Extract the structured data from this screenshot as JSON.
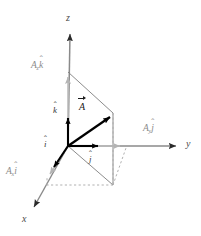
{
  "figure": {
    "background_color": "#ffffff",
    "width": 201,
    "height": 236
  },
  "colors": {
    "axis": "#6e6e6e",
    "vector": "#000000",
    "component_gray": "#b0b0b0",
    "construction_solid": "#7a7a7a",
    "construction_dashed": "#a8a8a8",
    "label_dark": "#1a1a1a",
    "label_gray": "#8a8a8a"
  },
  "axes": [
    {
      "name": "z",
      "label": "z",
      "direction": "up",
      "tip_x": 70,
      "tip_y": 28
    },
    {
      "name": "y",
      "label": "y",
      "direction": "right",
      "tip_x": 183,
      "tip_y": 146
    },
    {
      "name": "x",
      "label": "x",
      "direction": "down-left",
      "tip_x": 31,
      "tip_y": 212
    }
  ],
  "origin": {
    "x": 68,
    "y": 146
  },
  "vector": {
    "label_main": "A",
    "tip_x": 113,
    "tip_y": 113
  },
  "unit_vectors": [
    {
      "name": "i-hat",
      "base": "i",
      "label_x": 46,
      "label_y": 143
    },
    {
      "name": "j-hat",
      "base": "j",
      "label_x": 92,
      "label_y": 157
    },
    {
      "name": "k-hat",
      "base": "k",
      "label_x": 55,
      "label_y": 109
    }
  ],
  "components": [
    {
      "name": "z-component",
      "coefficient": "A",
      "subscript": "z",
      "unit": "k",
      "label_x": 33,
      "label_y": 65,
      "arrow_tip_x": 68,
      "arrow_tip_y": 72
    },
    {
      "name": "y-component",
      "coefficient": "A",
      "subscript": "y",
      "unit": "j",
      "label_x": 146,
      "label_y": 129,
      "arrow_tip_x": 125,
      "arrow_tip_y": 146
    },
    {
      "name": "x-component",
      "coefficient": "A",
      "subscript": "x",
      "unit": "i",
      "label_x": 8,
      "label_y": 172,
      "arrow_tip_x": 47,
      "arrow_tip_y": 178
    }
  ]
}
